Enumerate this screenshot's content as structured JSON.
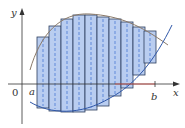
{
  "diagram": {
    "labels": {
      "y_axis": "y",
      "x_axis": "x",
      "origin": "0",
      "a": "a",
      "b": "b"
    },
    "colors": {
      "rect_fill": "#b9cdf0",
      "rect_stroke": "#2b3d5c",
      "midline": "#3a6fd0",
      "upper_curve": "#8a7a6a",
      "lower_curve": "#2f57a8",
      "axis": "#333333",
      "ab_segment": "#d9534f"
    },
    "rectangles": [
      {
        "x": 37,
        "top": 37,
        "bottom": 108
      },
      {
        "x": 49,
        "top": 26,
        "bottom": 111
      },
      {
        "x": 61,
        "top": 19,
        "bottom": 112
      },
      {
        "x": 73,
        "top": 15,
        "bottom": 112
      },
      {
        "x": 85,
        "top": 15,
        "bottom": 110
      },
      {
        "x": 97,
        "top": 17,
        "bottom": 106
      },
      {
        "x": 109,
        "top": 19,
        "bottom": 96
      },
      {
        "x": 121,
        "top": 22,
        "bottom": 88
      },
      {
        "x": 133,
        "top": 27,
        "bottom": 75
      },
      {
        "x": 144,
        "top": 31,
        "bottom": 63
      }
    ],
    "rect_width": 12
  }
}
